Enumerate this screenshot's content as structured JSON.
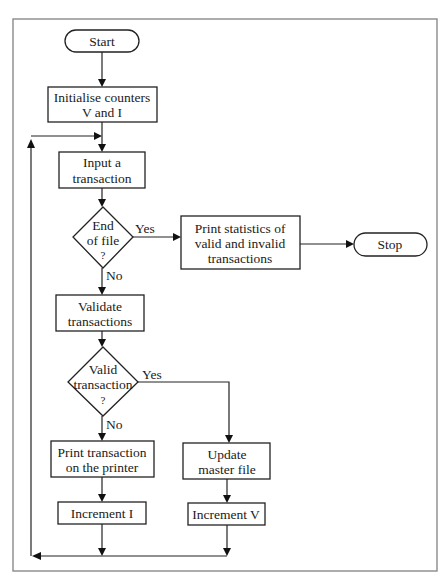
{
  "diagram": {
    "type": "flowchart",
    "nodes": {
      "start": {
        "kind": "terminal",
        "lines": [
          "Start"
        ]
      },
      "init": {
        "kind": "process",
        "lines": [
          "Initialise counters",
          "V and I"
        ]
      },
      "input": {
        "kind": "process",
        "lines": [
          "Input a",
          "transaction"
        ]
      },
      "eof": {
        "kind": "decision",
        "lines": [
          "End",
          "of file",
          "?"
        ]
      },
      "stats": {
        "kind": "process",
        "lines": [
          "Print statistics of",
          "valid and invalid",
          "transactions"
        ]
      },
      "stop": {
        "kind": "terminal",
        "lines": [
          "Stop"
        ]
      },
      "validate": {
        "kind": "process",
        "lines": [
          "Validate",
          "transactions"
        ]
      },
      "valid": {
        "kind": "decision",
        "lines": [
          "Valid",
          "transaction",
          "?"
        ]
      },
      "print_txn": {
        "kind": "process",
        "lines": [
          "Print transaction",
          "on the printer"
        ]
      },
      "update": {
        "kind": "process",
        "lines": [
          "Update",
          "master file"
        ]
      },
      "inc_i": {
        "kind": "process",
        "lines": [
          "Increment I"
        ]
      },
      "inc_v": {
        "kind": "process",
        "lines": [
          "Increment V"
        ]
      }
    },
    "edges": [
      {
        "from": "start",
        "to": "init",
        "label": ""
      },
      {
        "from": "init",
        "to": "input",
        "label": ""
      },
      {
        "from": "input",
        "to": "eof",
        "label": ""
      },
      {
        "from": "eof",
        "to": "stats",
        "label": "Yes"
      },
      {
        "from": "stats",
        "to": "stop",
        "label": ""
      },
      {
        "from": "eof",
        "to": "validate",
        "label": "No"
      },
      {
        "from": "validate",
        "to": "valid",
        "label": ""
      },
      {
        "from": "valid",
        "to": "update",
        "label": "Yes"
      },
      {
        "from": "valid",
        "to": "print_txn",
        "label": "No"
      },
      {
        "from": "print_txn",
        "to": "inc_i",
        "label": ""
      },
      {
        "from": "update",
        "to": "inc_v",
        "label": ""
      },
      {
        "from": "inc_i",
        "to": "input",
        "label": "loop back"
      },
      {
        "from": "inc_v",
        "to": "input",
        "label": "loop back"
      }
    ],
    "edge_labels": {
      "eof_yes": "Yes",
      "eof_no": "No",
      "valid_yes": "Yes",
      "valid_no": "No"
    }
  }
}
